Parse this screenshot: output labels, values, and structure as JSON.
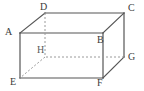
{
  "figure": {
    "type": "geometry-diagram",
    "shape_name": "rectangular-prism",
    "background_color": "#ffffff",
    "solid_edge_color": "#555555",
    "hidden_edge_color": "#9a9a9a",
    "label_color": "#3b3b3b",
    "vertices": [
      {
        "id": "A",
        "label": "A",
        "x": 20,
        "y": 33,
        "hidden": false,
        "label_x": 5,
        "label_y": 27
      },
      {
        "id": "B",
        "label": "B",
        "x": 103,
        "y": 33,
        "hidden": false,
        "label_x": 97,
        "label_y": 35
      },
      {
        "id": "C",
        "label": "C",
        "x": 124,
        "y": 13,
        "hidden": false,
        "label_x": 128,
        "label_y": 3
      },
      {
        "id": "D",
        "label": "D",
        "x": 45,
        "y": 13,
        "hidden": false,
        "label_x": 40,
        "label_y": 2
      },
      {
        "id": "E",
        "label": "E",
        "x": 20,
        "y": 78,
        "hidden": false,
        "label_x": 10,
        "label_y": 77
      },
      {
        "id": "F",
        "label": "F",
        "x": 103,
        "y": 78,
        "hidden": false,
        "label_x": 97,
        "label_y": 78
      },
      {
        "id": "G",
        "label": "G",
        "x": 124,
        "y": 57,
        "hidden": false,
        "label_x": 128,
        "label_y": 52
      },
      {
        "id": "H",
        "label": "H",
        "x": 45,
        "y": 57,
        "hidden": true,
        "label_x": 37,
        "label_y": 45
      }
    ],
    "edges": [
      {
        "from": "A",
        "to": "B",
        "style": "solid",
        "name": "edge-a-b"
      },
      {
        "from": "B",
        "to": "C",
        "style": "solid",
        "name": "edge-b-c"
      },
      {
        "from": "C",
        "to": "D",
        "style": "solid",
        "name": "edge-c-d"
      },
      {
        "from": "D",
        "to": "A",
        "style": "solid",
        "name": "edge-d-a"
      },
      {
        "from": "E",
        "to": "F",
        "style": "solid",
        "name": "edge-e-f"
      },
      {
        "from": "F",
        "to": "G",
        "style": "solid",
        "name": "edge-f-g"
      },
      {
        "from": "G",
        "to": "H",
        "style": "dashed",
        "name": "edge-g-h"
      },
      {
        "from": "H",
        "to": "E",
        "style": "dashed",
        "name": "edge-h-e"
      },
      {
        "from": "A",
        "to": "E",
        "style": "solid",
        "name": "edge-a-e"
      },
      {
        "from": "B",
        "to": "F",
        "style": "solid",
        "name": "edge-b-f"
      },
      {
        "from": "C",
        "to": "G",
        "style": "solid",
        "name": "edge-c-g"
      },
      {
        "from": "D",
        "to": "H",
        "style": "dashed",
        "name": "edge-d-h"
      }
    ]
  }
}
